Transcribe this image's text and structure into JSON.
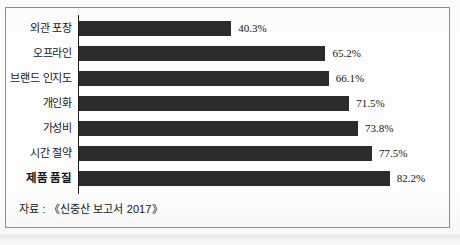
{
  "figure": {
    "source_note": "자료 : 《신중산 보고서 2017》"
  },
  "chart_data": {
    "type": "bar",
    "orientation": "horizontal",
    "title": "",
    "subtitle": "",
    "xlabel": "",
    "ylabel": "",
    "xlim": [
      0,
      100
    ],
    "grid": false,
    "legend": false,
    "axis_line": "vertical-left",
    "value_label_suffix": "%",
    "bar_color": "#2b2b2b",
    "categories": [
      "외관 포장",
      "오프라인",
      "브랜드 인지도",
      "개인화",
      "가성비",
      "시간 절약",
      "제품 품질"
    ],
    "values": [
      40.3,
      65.2,
      66.1,
      71.5,
      73.8,
      77.5,
      82.2
    ],
    "value_labels": [
      "40.3%",
      "65.2%",
      "66.1%",
      "71.5%",
      "73.8%",
      "77.5%",
      "82.2%"
    ],
    "emphasized_categories": [
      "제품 품질"
    ]
  }
}
